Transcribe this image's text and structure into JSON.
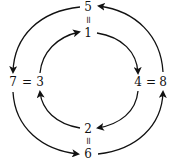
{
  "diagram": {
    "type": "cycle-diagram",
    "colors": {
      "stroke": "#111111",
      "background": "#ffffff"
    },
    "nodes": {
      "top_outer": "5",
      "top_eq": "=",
      "top_inner": "1",
      "left_outer": "7",
      "left_eq": "=",
      "left_inner": "3",
      "right_inner": "4",
      "right_eq": "=",
      "right_outer": "8",
      "bottom_inner": "2",
      "bottom_eq": "=",
      "bottom_outer": "6"
    },
    "inner_cycle": [
      "1",
      "4",
      "2",
      "3"
    ],
    "outer_cycle": [
      "5",
      "7",
      "6",
      "8"
    ],
    "equivalences": [
      [
        "5",
        "1"
      ],
      [
        "7",
        "3"
      ],
      [
        "4",
        "8"
      ],
      [
        "2",
        "6"
      ]
    ]
  }
}
